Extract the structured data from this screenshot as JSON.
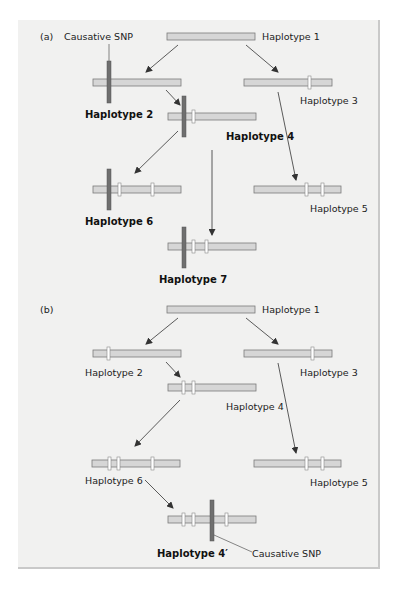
{
  "figure": {
    "colors": {
      "panel_bg": "#f1f1f0",
      "bar_fill": "#d6d6d6",
      "bar_stroke": "#7a7a7a",
      "marker_fill": "#ffffff",
      "causative_snp": "#6f6f6f",
      "arrow": "#333333"
    },
    "part_a": {
      "label": "(a)",
      "causative_label": "Causative SNP",
      "haplotypes": [
        {
          "id": "1",
          "label": "Haplotype 1",
          "bold": false,
          "causative": false,
          "markers": 0
        },
        {
          "id": "2",
          "label": "Haplotype 2",
          "bold": true,
          "causative": true,
          "markers": 0
        },
        {
          "id": "3",
          "label": "Haplotype 3",
          "bold": false,
          "causative": false,
          "markers": 1
        },
        {
          "id": "4",
          "label": "Haplotype 4",
          "bold": true,
          "causative": true,
          "markers": 1
        },
        {
          "id": "5",
          "label": "Haplotype 5",
          "bold": false,
          "causative": false,
          "markers": 2
        },
        {
          "id": "6",
          "label": "Haplotype 6",
          "bold": true,
          "causative": true,
          "markers": 2
        },
        {
          "id": "7",
          "label": "Haplotype 7",
          "bold": true,
          "causative": true,
          "markers": 2
        }
      ],
      "edges": [
        [
          "1",
          "2"
        ],
        [
          "1",
          "3"
        ],
        [
          "2",
          "4"
        ],
        [
          "4",
          "6"
        ],
        [
          "4",
          "7"
        ],
        [
          "3",
          "5"
        ]
      ]
    },
    "part_b": {
      "label": "(b)",
      "causative_label": "Causative SNP",
      "haplotypes": [
        {
          "id": "1",
          "label": "Haplotype 1",
          "bold": false,
          "causative": false,
          "markers": 0
        },
        {
          "id": "2",
          "label": "Haplotype 2",
          "bold": false,
          "causative": false,
          "markers": 1
        },
        {
          "id": "3",
          "label": "Haplotype 3",
          "bold": false,
          "causative": false,
          "markers": 1
        },
        {
          "id": "4",
          "label": "Haplotype 4",
          "bold": false,
          "causative": false,
          "markers": 2
        },
        {
          "id": "5",
          "label": "Haplotype 5",
          "bold": false,
          "causative": false,
          "markers": 2
        },
        {
          "id": "6",
          "label": "Haplotype 6",
          "bold": false,
          "causative": false,
          "markers": 3
        },
        {
          "id": "4p",
          "label": "Haplotype 4′",
          "bold": true,
          "causative": true,
          "markers": 3
        }
      ],
      "edges": [
        [
          "1",
          "2"
        ],
        [
          "1",
          "3"
        ],
        [
          "2",
          "4"
        ],
        [
          "4",
          "6"
        ],
        [
          "3",
          "5"
        ],
        [
          "6",
          "4p"
        ]
      ]
    }
  }
}
